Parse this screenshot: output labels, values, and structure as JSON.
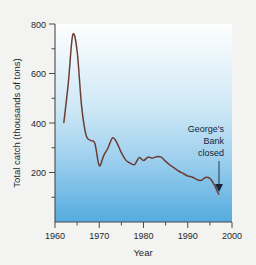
{
  "chart_data": {
    "type": "line",
    "title": "",
    "xlabel": "Year",
    "ylabel": "Total catch (thousands of tons)",
    "xlim": [
      1960,
      2000
    ],
    "ylim": [
      0,
      800
    ],
    "xticks": [
      1960,
      1970,
      1980,
      1990,
      2000
    ],
    "xtick_labels": [
      "1960",
      "1970",
      "1980",
      "1990",
      "2000"
    ],
    "xminor_ticks": [
      1965,
      1975,
      1985,
      1995
    ],
    "yticks": [
      200,
      400,
      600,
      800
    ],
    "ytick_labels": [
      "200",
      "400",
      "600",
      "800"
    ],
    "yminor_ticks": [
      100,
      300,
      500,
      700
    ],
    "grid": false,
    "legend": null,
    "line_color": "#6d3d33",
    "plot_bg_top_color": "#fdfefe",
    "plot_bg_bottom_color": "#57ace0",
    "page_bg_color": "#f3f3f1",
    "x": [
      1962,
      1963,
      1964,
      1965,
      1966,
      1967,
      1968,
      1969,
      1970,
      1971,
      1972,
      1973,
      1974,
      1975,
      1976,
      1977,
      1978,
      1979,
      1980,
      1981,
      1982,
      1983,
      1984,
      1985,
      1986,
      1987,
      1988,
      1989,
      1990,
      1991,
      1992,
      1993,
      1994,
      1995,
      1996,
      1997
    ],
    "values": [
      402,
      560,
      755,
      690,
      470,
      352,
      330,
      318,
      228,
      268,
      300,
      340,
      320,
      280,
      250,
      238,
      232,
      260,
      248,
      262,
      258,
      264,
      262,
      245,
      230,
      218,
      205,
      196,
      186,
      182,
      172,
      168,
      180,
      176,
      150,
      112
    ],
    "annotations": [
      {
        "text_lines": [
          "George's",
          "Bank",
          "closed"
        ],
        "text": "George's Bank closed",
        "points_to_x": 1997,
        "points_to_y": 145,
        "arrow": "down"
      }
    ]
  }
}
